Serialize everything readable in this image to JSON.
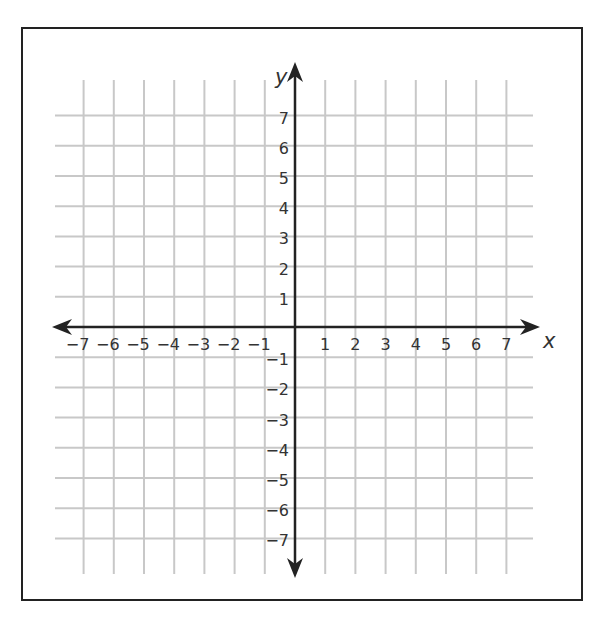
{
  "chart_data": {
    "type": "coordinate-grid",
    "title": "",
    "xlabel": "x",
    "ylabel": "y",
    "xlim": [
      -7,
      7
    ],
    "ylim": [
      -7,
      7
    ],
    "grid": true,
    "x_ticks": [
      "-7",
      "-6",
      "-5",
      "-4",
      "-3",
      "-2",
      "-1",
      "1",
      "2",
      "3",
      "4",
      "5",
      "6",
      "7"
    ],
    "y_ticks": [
      "7",
      "6",
      "5",
      "4",
      "3",
      "2",
      "1",
      "-1",
      "-2",
      "-3",
      "-4",
      "-5",
      "-6",
      "-7"
    ],
    "data_points": []
  },
  "axes": {
    "x_label": "x",
    "y_label": "y"
  },
  "colors": {
    "grid": "#c8c8c8",
    "axis": "#222222",
    "frame": "#222222",
    "text": "#333333"
  }
}
